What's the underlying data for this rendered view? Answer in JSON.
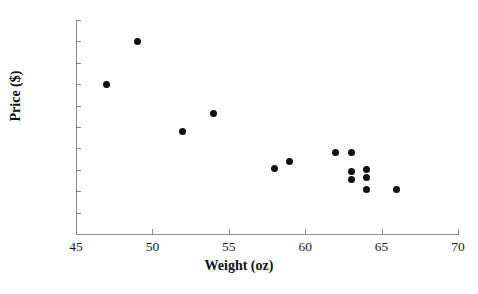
{
  "chart_data": {
    "type": "scatter",
    "title": "",
    "xlabel": "Weight (oz)",
    "ylabel": "Price ($)",
    "xlim": [
      45,
      70
    ],
    "ylim": [
      0,
      1000
    ],
    "xticks": [
      45,
      50,
      55,
      60,
      65,
      70
    ],
    "yticks": [
      0,
      100,
      200,
      300,
      400,
      500,
      600,
      700,
      800,
      900,
      1000
    ],
    "xtick_labels": [
      "45",
      "50",
      "55",
      "60",
      "65",
      "70"
    ],
    "ytick_labels": [
      "0",
      "100",
      "200",
      "300",
      "400",
      "500",
      "600",
      "700",
      "800",
      "900",
      "1000"
    ],
    "grid": false,
    "legend": false,
    "marker": "filled-circle",
    "marker_color": "#101010",
    "axis_color": "#8a8a8a",
    "points": [
      {
        "x": 47,
        "y": 700
      },
      {
        "x": 49,
        "y": 900
      },
      {
        "x": 52,
        "y": 480
      },
      {
        "x": 54,
        "y": 565
      },
      {
        "x": 58,
        "y": 305
      },
      {
        "x": 59,
        "y": 340
      },
      {
        "x": 62,
        "y": 380
      },
      {
        "x": 63,
        "y": 380
      },
      {
        "x": 63,
        "y": 290
      },
      {
        "x": 63,
        "y": 255
      },
      {
        "x": 64,
        "y": 300
      },
      {
        "x": 64,
        "y": 265
      },
      {
        "x": 64,
        "y": 210
      },
      {
        "x": 66,
        "y": 210
      }
    ]
  }
}
